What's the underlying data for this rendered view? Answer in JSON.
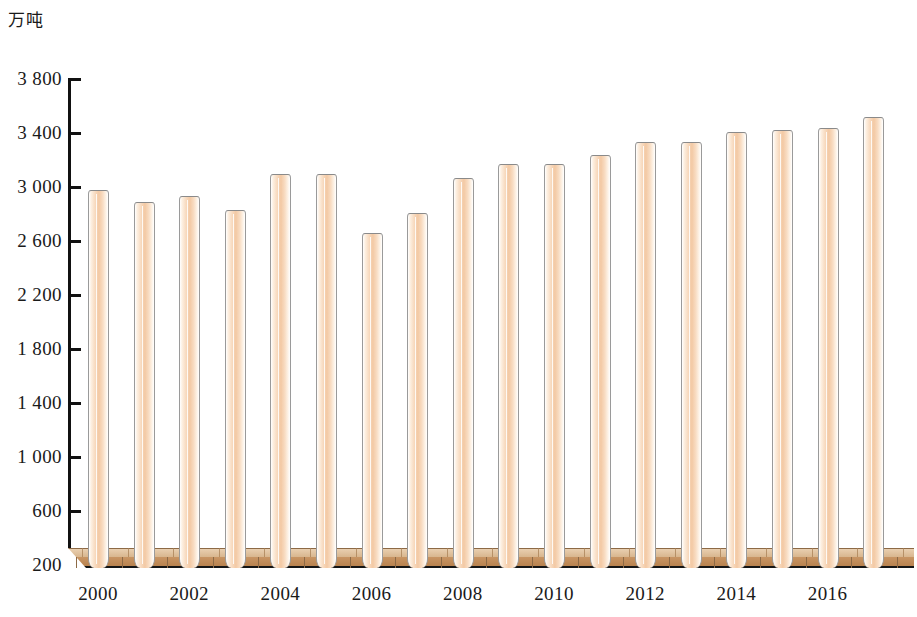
{
  "chart_data": {
    "type": "bar",
    "title": "",
    "subtitle": "",
    "xlabel": "",
    "ylabel": "万吨",
    "unit_caption": "万吨",
    "ylim": [
      200,
      3800
    ],
    "y_tick_step": 400,
    "grid": false,
    "legend": "none",
    "baseline_value": 200,
    "categories": [
      "2000",
      "2001",
      "2002",
      "2003",
      "2004",
      "2005",
      "2006",
      "2007",
      "2008",
      "2009",
      "2010",
      "2011",
      "2012",
      "2013",
      "2014",
      "2015",
      "2016",
      "2017"
    ],
    "values": [
      2980,
      2890,
      2930,
      2830,
      3100,
      3100,
      2660,
      2810,
      3070,
      3170,
      3170,
      3240,
      3330,
      3330,
      3410,
      3420,
      3440,
      3520
    ],
    "y_ticks": [
      "200",
      "600",
      "1 000",
      "1 400",
      "1 800",
      "2 200",
      "2 600",
      "3 000",
      "3 400",
      "3 800"
    ],
    "y_tick_values": [
      200,
      600,
      1000,
      1400,
      1800,
      2200,
      2600,
      3000,
      3400,
      3800
    ],
    "x_tick_labels": [
      "2000",
      "",
      "2002",
      "",
      "2004",
      "",
      "2006",
      "",
      "2008",
      "",
      "2010",
      "",
      "2012",
      "",
      "2014",
      "",
      "2016",
      ""
    ],
    "colors": {
      "bar_light": "#ffffff",
      "bar_mid": "#f8dcc2",
      "bar_core": "#f3c9a4",
      "bar_outline": "#9a9a9a",
      "ground_top": "#e9cfb0",
      "ground_face": "#c89564",
      "axis": "#111111",
      "text": "#1a1a1a",
      "background": "#ffffff"
    }
  }
}
